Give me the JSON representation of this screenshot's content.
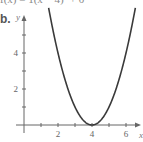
{
  "header": {
    "partial_text": "f(x) = 1(x − 4)² + 0"
  },
  "part_label": "b.",
  "chart_data": {
    "type": "line",
    "title": "",
    "function": "y = (x - 4)^2",
    "xlabel": "x",
    "ylabel": "y",
    "xlim": [
      -0.5,
      7
    ],
    "ylim": [
      -0.5,
      6
    ],
    "x_ticks": [
      1,
      2,
      3,
      4,
      5,
      6
    ],
    "x_tick_labels": [
      "2",
      "4",
      "6"
    ],
    "y_ticks": [
      1,
      2,
      3,
      4,
      5
    ],
    "y_tick_labels": [
      "2",
      "4"
    ],
    "grid": false,
    "series": [
      {
        "name": "parabola",
        "x": [
          1.5,
          2,
          2.5,
          3,
          3.5,
          4,
          4.5,
          5,
          5.5,
          6,
          6.5
        ],
        "y": [
          6.25,
          4,
          2.25,
          1,
          0.25,
          0,
          0.25,
          1,
          2.25,
          4,
          6.25
        ]
      }
    ],
    "vertex": [
      4,
      0
    ],
    "line_color": "#3a3a3a"
  }
}
